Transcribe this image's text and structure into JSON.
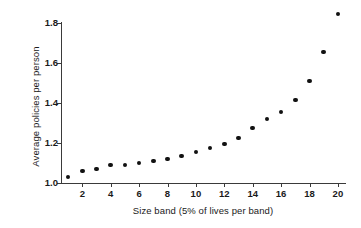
{
  "chart_data": {
    "type": "scatter",
    "title": "",
    "xlabel": "Size band (5% of lives per band)",
    "ylabel": "Average policies per person",
    "xlim": [
      0.5,
      20.5
    ],
    "ylim": [
      1.0,
      1.8
    ],
    "grid": false,
    "legend": null,
    "xticks": [
      2,
      4,
      6,
      8,
      10,
      12,
      14,
      16,
      18,
      20
    ],
    "xticklabels": [
      "2",
      "4",
      "6",
      "8",
      "10",
      "12",
      "14",
      "16",
      "18",
      "20"
    ],
    "yticks": [
      1.0,
      1.2,
      1.4,
      1.6,
      1.8
    ],
    "yticklabels": [
      "1.0",
      "1.2",
      "1.4",
      "1.6",
      "1.8"
    ],
    "marker": "filled-circle",
    "marker_color": "#111111",
    "x": [
      1,
      2,
      3,
      4,
      5,
      6,
      7,
      8,
      9,
      10,
      11,
      12,
      13,
      14,
      15,
      16,
      17,
      18,
      19,
      20
    ],
    "values": [
      1.03,
      1.06,
      1.07,
      1.09,
      1.09,
      1.1,
      1.11,
      1.12,
      1.135,
      1.155,
      1.175,
      1.195,
      1.225,
      1.275,
      1.32,
      1.355,
      1.415,
      1.51,
      1.655,
      1.845
    ]
  }
}
